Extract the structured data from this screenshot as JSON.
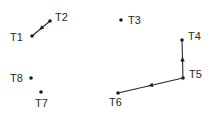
{
  "diagram": {
    "type": "directed-graph",
    "colors": {
      "background": "#ffffff",
      "ink": "#1e1e1e"
    },
    "nodes": [
      {
        "id": "T1",
        "label": "T1",
        "x": 32,
        "y": 36,
        "label_x": 10,
        "label_y": 41
      },
      {
        "id": "T2",
        "label": "T2",
        "x": 50,
        "y": 21,
        "label_x": 55,
        "label_y": 21
      },
      {
        "id": "T3",
        "label": "T3",
        "x": 121,
        "y": 20,
        "label_x": 128,
        "label_y": 24
      },
      {
        "id": "T4",
        "label": "T4",
        "x": 182,
        "y": 40,
        "label_x": 188,
        "label_y": 40
      },
      {
        "id": "T5",
        "label": "T5",
        "x": 183,
        "y": 78,
        "label_x": 189,
        "label_y": 78
      },
      {
        "id": "T6",
        "label": "T6",
        "x": 118,
        "y": 93,
        "label_x": 109,
        "label_y": 106
      },
      {
        "id": "T7",
        "label": "T7",
        "x": 41,
        "y": 92,
        "label_x": 35,
        "label_y": 107
      },
      {
        "id": "T8",
        "label": "T8",
        "x": 31,
        "y": 78,
        "label_x": 10,
        "label_y": 82
      }
    ],
    "edges": [
      {
        "from": "T2",
        "to": "T1"
      },
      {
        "from": "T5",
        "to": "T4"
      },
      {
        "from": "T5",
        "to": "T6"
      }
    ]
  }
}
